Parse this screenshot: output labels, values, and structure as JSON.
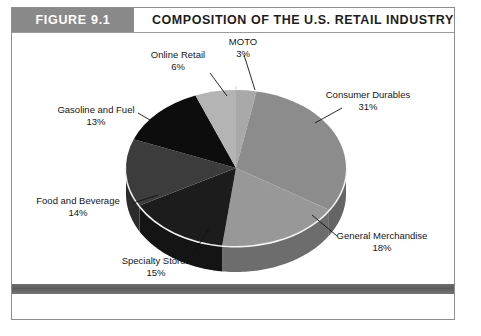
{
  "figure": {
    "number_label": "FIGURE 9.1",
    "title": "COMPOSITION OF THE U.S. RETAIL INDUSTRY",
    "header_bg": "#898989",
    "header_text_color": "#ffffff",
    "frame_border": "#8d8d8d",
    "footer_bar_color": "#5d5d5d"
  },
  "chart_data": {
    "type": "pie",
    "title": "COMPOSITION OF THE U.S. RETAIL INDUSTRY",
    "xlabel": "",
    "ylabel": "",
    "grid": false,
    "legend_position": "none",
    "three_d": true,
    "start_angle_deg": 0,
    "direction": "clockwise",
    "labels_show_percent": true,
    "categories": [
      "MOTO",
      "Consumer Durables",
      "General Merchandise",
      "Specialty Stores",
      "Food and Beverage",
      "Gasoline and Fuel",
      "Online Retail"
    ],
    "values": [
      3,
      31,
      18,
      15,
      14,
      13,
      6
    ],
    "value_labels": [
      "3%",
      "31%",
      "18%",
      "15%",
      "14%",
      "13%",
      "6%"
    ],
    "colors": [
      "#a9a9a9",
      "#8c8c8c",
      "#989898",
      "#1c1c1c",
      "#3c3c3c",
      "#0d0d0d",
      "#b4b4b4"
    ],
    "slices": [
      {
        "name": "MOTO",
        "value": 3,
        "value_label": "3%",
        "color": "#a9a9a9"
      },
      {
        "name": "Consumer Durables",
        "value": 31,
        "value_label": "31%",
        "color": "#8c8c8c"
      },
      {
        "name": "General Merchandise",
        "value": 18,
        "value_label": "18%",
        "color": "#989898"
      },
      {
        "name": "Specialty Stores",
        "value": 15,
        "value_label": "15%",
        "color": "#1c1c1c"
      },
      {
        "name": "Food and Beverage",
        "value": 14,
        "value_label": "14%",
        "color": "#3c3c3c"
      },
      {
        "name": "Gasoline and Fuel",
        "value": 13,
        "value_label": "13%",
        "color": "#0d0d0d"
      },
      {
        "name": "Online Retail",
        "value": 6,
        "value_label": "6%",
        "color": "#b4b4b4"
      }
    ],
    "total": 100
  },
  "labels": {
    "moto": {
      "name": "MOTO",
      "pct": "3%"
    },
    "consumer_durables": {
      "name": "Consumer Durables",
      "pct": "31%"
    },
    "general_merchandise": {
      "name": "General Merchandise",
      "pct": "18%"
    },
    "specialty_stores": {
      "name": "Specialty Stores",
      "pct": "15%"
    },
    "food_and_beverage": {
      "name": "Food and Beverage",
      "pct": "14%"
    },
    "gasoline_and_fuel": {
      "name": "Gasoline and Fuel",
      "pct": "13%"
    },
    "online_retail": {
      "name": "Online Retail",
      "pct": "6%"
    }
  }
}
